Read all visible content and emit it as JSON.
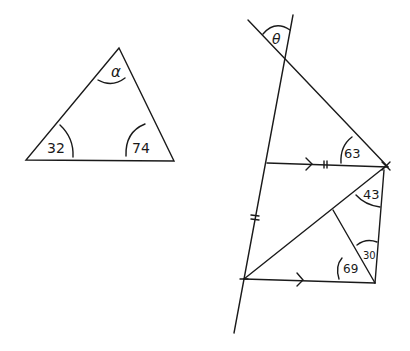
{
  "diagram": {
    "ink_color": "#1a1a1a",
    "background": "#ffffff",
    "triangle_left": {
      "angles": {
        "apex": "α",
        "bottom_left": "32",
        "bottom_right": "74"
      }
    },
    "figure_right": {
      "angle_top": "θ",
      "angle_top_parallel": "63",
      "angle_upper_right": "43",
      "angle_right_mid": "30",
      "angle_bottom_right": "69",
      "equal_marks": "||",
      "parallel_marks": ">"
    }
  }
}
